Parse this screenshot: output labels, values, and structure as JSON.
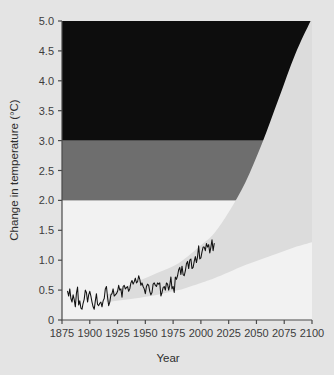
{
  "chart_data": {
    "type": "area",
    "title": "",
    "xlabel": "Year",
    "ylabel": "Change in temperature (°C)",
    "xlim": [
      1875,
      2100
    ],
    "ylim": [
      0,
      5.0
    ],
    "grid": false,
    "legend": "none",
    "xticks": [
      1875,
      1900,
      1925,
      1950,
      1975,
      2000,
      2025,
      2050,
      2075,
      2100
    ],
    "xtick_labels": [
      "1875",
      "1900",
      "1925",
      "1950",
      "1975",
      "2000",
      "2025",
      "2050",
      "2075",
      "2100"
    ],
    "yticks": [
      0,
      0.5,
      1.0,
      1.5,
      2.0,
      2.5,
      3.0,
      3.5,
      4.0,
      4.5,
      5.0
    ],
    "ytick_labels": [
      "0",
      "0.5",
      "1.0",
      "1.5",
      "2.0",
      "2.5",
      "3.0",
      "3.5",
      "4.0",
      "4.5",
      "5.0"
    ],
    "bands": [
      {
        "name": "moderate-warming-band",
        "from": 2.0,
        "to": 3.0,
        "color": "#6e6e6e"
      },
      {
        "name": "severe-warming-band",
        "from": 3.0,
        "to": 5.0,
        "color": "#0d0d0d"
      }
    ],
    "plot_background": "#f2f2f2",
    "series": [
      {
        "name": "Observed temperature change",
        "type": "line",
        "color": "#111111",
        "x": [
          1880,
          1881,
          1882,
          1883,
          1884,
          1885,
          1886,
          1887,
          1888,
          1889,
          1890,
          1891,
          1892,
          1893,
          1894,
          1895,
          1896,
          1897,
          1898,
          1899,
          1900,
          1901,
          1902,
          1903,
          1904,
          1905,
          1906,
          1907,
          1908,
          1909,
          1910,
          1911,
          1912,
          1913,
          1914,
          1915,
          1916,
          1917,
          1918,
          1919,
          1920,
          1921,
          1922,
          1923,
          1924,
          1925,
          1926,
          1927,
          1928,
          1929,
          1930,
          1931,
          1932,
          1933,
          1934,
          1935,
          1936,
          1937,
          1938,
          1939,
          1940,
          1941,
          1942,
          1943,
          1944,
          1945,
          1946,
          1947,
          1948,
          1949,
          1950,
          1951,
          1952,
          1953,
          1954,
          1955,
          1956,
          1957,
          1958,
          1959,
          1960,
          1961,
          1962,
          1963,
          1964,
          1965,
          1966,
          1967,
          1968,
          1969,
          1970,
          1971,
          1972,
          1973,
          1974,
          1975,
          1976,
          1977,
          1978,
          1979,
          1980,
          1981,
          1982,
          1983,
          1984,
          1985,
          1986,
          1987,
          1988,
          1989,
          1990,
          1991,
          1992,
          1993,
          1994,
          1995,
          1996,
          1997,
          1998,
          1999,
          2000,
          2001,
          2002,
          2003,
          2004,
          2005,
          2006,
          2007,
          2008,
          2009,
          2010,
          2011,
          2012
        ],
        "y": [
          0.48,
          0.4,
          0.52,
          0.36,
          0.3,
          0.42,
          0.34,
          0.22,
          0.45,
          0.55,
          0.25,
          0.32,
          0.2,
          0.18,
          0.28,
          0.35,
          0.5,
          0.46,
          0.3,
          0.42,
          0.48,
          0.4,
          0.3,
          0.22,
          0.18,
          0.32,
          0.44,
          0.26,
          0.24,
          0.28,
          0.3,
          0.22,
          0.32,
          0.36,
          0.52,
          0.56,
          0.38,
          0.24,
          0.3,
          0.42,
          0.44,
          0.52,
          0.4,
          0.42,
          0.44,
          0.48,
          0.58,
          0.5,
          0.52,
          0.38,
          0.56,
          0.58,
          0.52,
          0.54,
          0.56,
          0.48,
          0.52,
          0.62,
          0.66,
          0.6,
          0.64,
          0.7,
          0.62,
          0.64,
          0.74,
          0.68,
          0.58,
          0.62,
          0.56,
          0.52,
          0.44,
          0.56,
          0.6,
          0.58,
          0.48,
          0.42,
          0.46,
          0.6,
          0.62,
          0.58,
          0.56,
          0.62,
          0.6,
          0.62,
          0.4,
          0.46,
          0.54,
          0.56,
          0.5,
          0.62,
          0.6,
          0.5,
          0.58,
          0.72,
          0.52,
          0.56,
          0.46,
          0.72,
          0.68,
          0.74,
          0.84,
          0.88,
          0.76,
          0.9,
          0.76,
          0.74,
          0.82,
          0.94,
          0.98,
          0.86,
          1.0,
          1.02,
          0.86,
          0.88,
          0.98,
          1.06,
          0.96,
          1.06,
          1.24,
          1.02,
          1.04,
          1.14,
          1.22,
          1.22,
          1.16,
          1.28,
          1.22,
          1.26,
          1.12,
          1.22,
          1.34,
          1.16,
          1.28
        ]
      }
    ],
    "projection_envelope": {
      "name": "Projected range of temperature change",
      "color": "#dcdcdc",
      "start_year": 1915,
      "end_year": 2100,
      "upper_at_2100": 5.0,
      "lower_at_2100": 1.3,
      "upper": [
        [
          1915,
          0.42
        ],
        [
          1940,
          0.62
        ],
        [
          1960,
          0.78
        ],
        [
          1980,
          0.95
        ],
        [
          2000,
          1.25
        ],
        [
          2012,
          1.45
        ],
        [
          2025,
          1.8
        ],
        [
          2040,
          2.3
        ],
        [
          2055,
          2.95
        ],
        [
          2070,
          3.7
        ],
        [
          2085,
          4.45
        ],
        [
          2100,
          5.05
        ]
      ],
      "lower": [
        [
          1915,
          0.3
        ],
        [
          1940,
          0.36
        ],
        [
          1960,
          0.42
        ],
        [
          1980,
          0.5
        ],
        [
          2000,
          0.62
        ],
        [
          2012,
          0.7
        ],
        [
          2025,
          0.8
        ],
        [
          2040,
          0.92
        ],
        [
          2055,
          1.02
        ],
        [
          2070,
          1.12
        ],
        [
          2085,
          1.22
        ],
        [
          2100,
          1.3
        ]
      ]
    }
  },
  "figure": {
    "background_color": "#e4e4e4"
  }
}
